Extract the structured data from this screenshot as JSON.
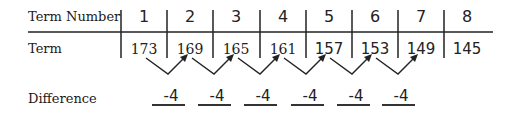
{
  "table": {
    "row_labels": {
      "term_number": "Term Number",
      "term": "Term",
      "difference": "Difference"
    },
    "term_numbers": [
      "1",
      "2",
      "3",
      "4",
      "5",
      "6",
      "7",
      "8"
    ],
    "terms": [
      "173",
      "169",
      "165",
      "161",
      "157",
      "153",
      "149",
      "145"
    ],
    "differences": [
      "-4",
      "-4",
      "-4",
      "-4",
      "-4",
      "-4"
    ]
  }
}
